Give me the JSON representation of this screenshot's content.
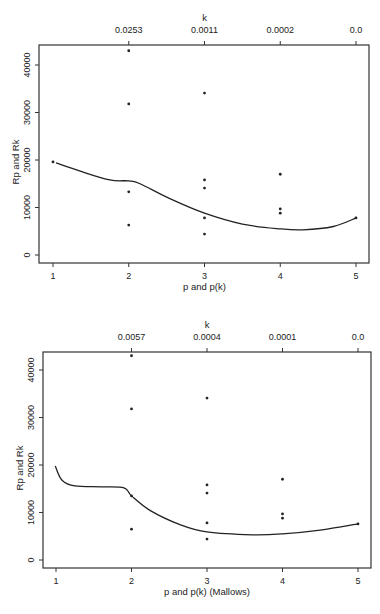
{
  "chart_data": [
    {
      "type": "scatter",
      "title": "",
      "xlabel": "p and p(k)",
      "ylabel": "Rp and Rk",
      "top_axis_label": "k",
      "top_ticks": [
        {
          "x": 2,
          "label": "0.0253"
        },
        {
          "x": 3,
          "label": "0.0011"
        },
        {
          "x": 4,
          "label": "0.0002"
        },
        {
          "x": 5,
          "label": "0.0"
        }
      ],
      "x_ticks": [
        1,
        2,
        3,
        4,
        5
      ],
      "y_ticks": [
        0,
        10000,
        20000,
        30000,
        40000
      ],
      "xlim": [
        0.82,
        5.17
      ],
      "ylim": [
        -1700,
        44500
      ],
      "grid": false,
      "points": [
        {
          "x": 1,
          "y": 19600
        },
        {
          "x": 2,
          "y": 43000
        },
        {
          "x": 2,
          "y": 31800
        },
        {
          "x": 2,
          "y": 13300
        },
        {
          "x": 2,
          "y": 6300
        },
        {
          "x": 3,
          "y": 34100
        },
        {
          "x": 3,
          "y": 15800
        },
        {
          "x": 3,
          "y": 14100
        },
        {
          "x": 3,
          "y": 7800
        },
        {
          "x": 3,
          "y": 4400
        },
        {
          "x": 4,
          "y": 17000
        },
        {
          "x": 4,
          "y": 9700
        },
        {
          "x": 4,
          "y": 8800
        },
        {
          "x": 5,
          "y": 7800
        }
      ],
      "curve": [
        [
          1.04,
          19400
        ],
        [
          1.35,
          17700
        ],
        [
          1.75,
          15800
        ],
        [
          2.0,
          15600
        ],
        [
          2.15,
          15000
        ],
        [
          2.55,
          11800
        ],
        [
          3.0,
          8800
        ],
        [
          3.5,
          6500
        ],
        [
          4.0,
          5500
        ],
        [
          4.3,
          5300
        ],
        [
          4.7,
          6000
        ],
        [
          5.0,
          7800
        ]
      ]
    },
    {
      "type": "scatter",
      "title": "",
      "xlabel": "p and p(k) (Mallows)",
      "ylabel": "Rp and Rk",
      "top_axis_label": "k",
      "top_ticks": [
        {
          "x": 2,
          "label": "0.0057"
        },
        {
          "x": 3,
          "label": "0.0004"
        },
        {
          "x": 4,
          "label": "0.0001"
        },
        {
          "x": 5,
          "label": "0.0"
        }
      ],
      "x_ticks": [
        1,
        2,
        3,
        4,
        5
      ],
      "y_ticks": [
        0,
        10000,
        20000,
        30000,
        40000
      ],
      "xlim": [
        0.83,
        5.17
      ],
      "ylim": [
        -1700,
        44200
      ],
      "grid": false,
      "points": [
        {
          "x": 2,
          "y": 43000
        },
        {
          "x": 2,
          "y": 31800
        },
        {
          "x": 2,
          "y": 13500
        },
        {
          "x": 2,
          "y": 6500
        },
        {
          "x": 3,
          "y": 34100
        },
        {
          "x": 3,
          "y": 15800
        },
        {
          "x": 3,
          "y": 14100
        },
        {
          "x": 3,
          "y": 7800
        },
        {
          "x": 3,
          "y": 4400
        },
        {
          "x": 4,
          "y": 17000
        },
        {
          "x": 4,
          "y": 9700
        },
        {
          "x": 4,
          "y": 8800
        },
        {
          "x": 5,
          "y": 7600
        }
      ],
      "curve": [
        [
          0.99,
          19800
        ],
        [
          1.08,
          16800
        ],
        [
          1.25,
          15600
        ],
        [
          1.6,
          15400
        ],
        [
          1.9,
          15200
        ],
        [
          2.0,
          13500
        ],
        [
          2.25,
          10400
        ],
        [
          2.65,
          7400
        ],
        [
          3.0,
          5900
        ],
        [
          3.6,
          5300
        ],
        [
          4.0,
          5500
        ],
        [
          4.5,
          6300
        ],
        [
          5.0,
          7600
        ]
      ]
    }
  ],
  "panels": [
    {
      "box": {
        "left": 39,
        "top": 45,
        "right": 369,
        "bottom": 263
      },
      "x_px": {
        "v1": 53,
        "v5": 356
      },
      "y_px": {
        "v0": 255,
        "v40000": 65
      }
    },
    {
      "box": {
        "left": 43,
        "top": 352,
        "right": 371,
        "bottom": 568
      },
      "x_px": {
        "v1": 56,
        "v5": 358
      },
      "y_px": {
        "v0": 560,
        "v40000": 370
      }
    }
  ]
}
